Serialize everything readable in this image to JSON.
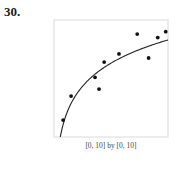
{
  "problem": {
    "number": "30."
  },
  "window_label": "[0, 10] by [0, 10]",
  "colors": {
    "frame": "#e6e6e6",
    "curve": "#222222",
    "points": "#111111"
  },
  "chart_data": {
    "type": "scatter",
    "title": "30.",
    "xlabel": "",
    "ylabel": "",
    "window": "[0, 10] by [0, 10]",
    "xlim": [
      0,
      10
    ],
    "ylim": [
      0,
      10
    ],
    "grid": false,
    "legend": null,
    "series": [
      {
        "name": "data points",
        "kind": "scatter",
        "x": [
          0.8,
          1.5,
          3.6,
          3.95,
          4.4,
          5.7,
          7.3,
          8.3,
          9.1,
          9.8
        ],
        "y": [
          1.45,
          3.5,
          5.1,
          4.1,
          6.4,
          7.1,
          8.8,
          6.75,
          8.5,
          9.0
        ]
      },
      {
        "name": "logarithmic regression curve",
        "kind": "line",
        "equation": "y = a + b ln(x)",
        "a": 1.71,
        "b": 2.86,
        "x_start": 0.55,
        "x_end": 10
      }
    ]
  }
}
